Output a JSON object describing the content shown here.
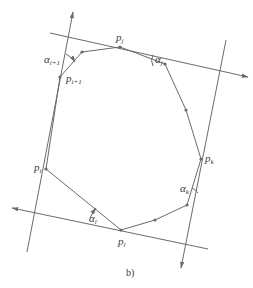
{
  "figure": {
    "caption": "b)",
    "colors": {
      "line": "#6a6a6a",
      "text": "#3a3a3a",
      "background": "#ffffff"
    }
  },
  "points": {
    "p_j": {
      "base": "p",
      "sub": "j",
      "x": 120,
      "y": 47
    },
    "p_i1": {
      "base": "p",
      "sub": "i+1",
      "x": 60,
      "y": 77
    },
    "p_i": {
      "base": "p",
      "sub": "i",
      "x": 46,
      "y": 169
    },
    "p_k": {
      "base": "p",
      "sub": "k",
      "x": 201,
      "y": 159
    },
    "p_l": {
      "base": "p",
      "sub": "l",
      "x": 121,
      "y": 230
    }
  },
  "angles": {
    "alpha_i1": {
      "base": "α",
      "sub": "i+1"
    },
    "alpha_j": {
      "base": "α",
      "sub": "j"
    },
    "alpha_k": {
      "base": "α",
      "sub": "k"
    },
    "alpha_l": {
      "base": "α",
      "sub": "l"
    }
  },
  "polygon_vertices": [
    [
      60,
      77
    ],
    [
      82,
      52
    ],
    [
      120,
      47
    ],
    [
      165,
      64
    ],
    [
      186,
      110
    ],
    [
      201,
      159
    ],
    [
      187,
      205
    ],
    [
      155,
      220
    ],
    [
      121,
      230
    ],
    [
      46,
      169
    ]
  ],
  "support_lines": [
    {
      "name": "left",
      "from": [
        27,
        252
      ],
      "to": [
        73,
        12
      ]
    },
    {
      "name": "top",
      "from": [
        50,
        33
      ],
      "to": [
        248,
        77
      ]
    },
    {
      "name": "right",
      "from": [
        226,
        40
      ],
      "to": [
        181,
        268
      ]
    },
    {
      "name": "bottom",
      "from": [
        208,
        249
      ],
      "to": [
        12,
        208
      ]
    }
  ]
}
